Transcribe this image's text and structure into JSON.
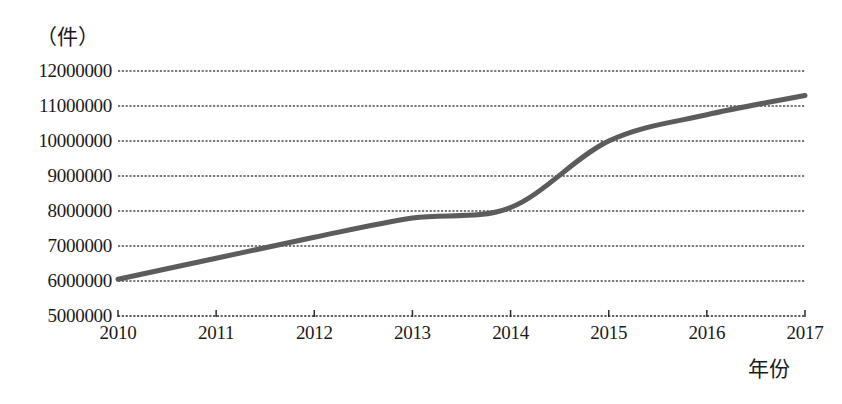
{
  "chart_data": {
    "type": "line",
    "title": "",
    "unit_label": "（件）",
    "xlabel": "年份",
    "ylabel": "",
    "categories": [
      "2010",
      "2011",
      "2012",
      "2013",
      "2014",
      "2015",
      "2016",
      "2017"
    ],
    "x": [
      2010,
      2011,
      2012,
      2013,
      2014,
      2015,
      2016,
      2017
    ],
    "values": [
      6050000,
      6650000,
      7250000,
      7800000,
      8100000,
      10000000,
      10750000,
      11300000
    ],
    "series": [
      {
        "name": "",
        "values": [
          6050000,
          6650000,
          7250000,
          7800000,
          8100000,
          10000000,
          10750000,
          11300000
        ]
      }
    ],
    "ylim": [
      5000000,
      12000000
    ],
    "xlim": [
      2010,
      2017
    ],
    "ytick_labels": [
      "12000000",
      "11000000",
      "10000000",
      "9000000",
      "8000000",
      "7000000",
      "6000000",
      "5000000"
    ],
    "ytick_values": [
      12000000,
      11000000,
      10000000,
      9000000,
      8000000,
      7000000,
      6000000,
      5000000
    ],
    "xtick_labels": [
      "2010",
      "2011",
      "2012",
      "2013",
      "2014",
      "2015",
      "2016",
      "2017"
    ],
    "grid": true,
    "grid_style": "dotted",
    "legend": false,
    "legend_position": "none",
    "line_color": "#5c5c5c",
    "grid_color": "#4d4d4d",
    "axis_color": "#2b2b2b",
    "background_color": "#ffffff",
    "smooth": true,
    "line_width": 5
  }
}
